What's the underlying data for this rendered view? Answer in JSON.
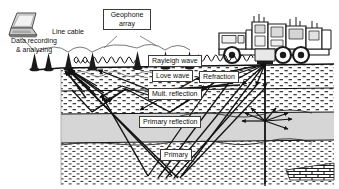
{
  "diagram": {
    "type": "seismic-survey-schematic",
    "labels": {
      "data_recording_line1": "Data recording",
      "data_recording_line2": "& analyzing",
      "line_cable": "Line cable",
      "geophone_array_line1": "Geophone",
      "geophone_array_line2": "array",
      "rayleigh_wave": "Rayleigh wave",
      "love_wave": "Love wave",
      "refraction": "Refraction",
      "mult_reflection": "Mult. reflection",
      "primary_reflection": "Primary reflection",
      "primary": "Primary"
    },
    "icons": {
      "laptop": "laptop-icon",
      "truck": "vibroseis-truck-icon",
      "geophone": "geophone-icon"
    },
    "colors": {
      "ink": "#111111",
      "layer_fill": "#ffffff",
      "shale_fill": "#d4d4d4",
      "hatch": "#2b2b2b",
      "background": "#ffffff"
    },
    "counts": {
      "geophones": 6,
      "surface_wave_coils": 2
    }
  }
}
